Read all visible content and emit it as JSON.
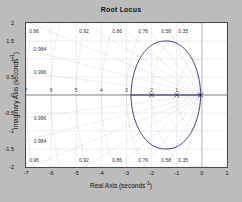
{
  "figure": {
    "background_color": "#bcbcbc",
    "plot_background_color": "#ffffff",
    "axis_color": "#4a4a4a"
  },
  "chart_data": {
    "type": "line",
    "title": "Root Locus",
    "xlabel_text": "Real Axis (seconds",
    "xlabel_exp": "-1",
    "xlabel_tail": ")",
    "ylabel_text": "Imaginary Axis (seconds",
    "ylabel_exp": "-1",
    "ylabel_tail": ")",
    "xlim": [
      -7,
      1
    ],
    "ylim": [
      -2,
      2
    ],
    "xticks": [
      "-7",
      "-6",
      "-5",
      "-4",
      "-3",
      "-2",
      "-1",
      "0",
      "1"
    ],
    "xtick_values": [
      -7,
      -6,
      -5,
      -4,
      -3,
      -2,
      -1,
      0,
      1
    ],
    "yticks": [
      "2",
      "1.5",
      "1",
      "0.5",
      "0",
      "-0.5",
      "-1",
      "-1.5",
      "-2"
    ],
    "ytick_values": [
      2,
      1.5,
      1,
      0.5,
      0,
      -0.5,
      -1,
      -1.5,
      -2
    ],
    "grid": "s-plane damping and natural frequency grid",
    "legend": "none",
    "grid_color": "#c8c8c8",
    "locus_color": "#1a1a6e",
    "marker_color": "#1a1a6e",
    "damping_ratios": [
      0.35,
      0.58,
      0.76,
      0.86,
      0.92,
      0.96,
      0.984,
      0.996
    ],
    "damping_labels_top": [
      "0.96",
      "0.92",
      "0.86",
      "0.76",
      "0.58",
      "0.35"
    ],
    "damping_labels_left_upper": [
      "0.984",
      "0.996"
    ],
    "damping_labels_left_lower": [
      "0.996",
      "0.984"
    ],
    "damping_labels_bottom": [
      "0.96",
      "0.92",
      "0.86",
      "0.76",
      "0.58",
      "0.35"
    ],
    "natural_frequencies": [
      1,
      2,
      3,
      4,
      5,
      6,
      7
    ],
    "natural_frequency_labels": [
      "7",
      "6",
      "5",
      "4",
      "3",
      "2",
      "1"
    ],
    "series": [
      {
        "name": "root-locus-branch",
        "description": "closed oval locus branch from breakaway near -2.8 to poles near origin",
        "real_left": -2.82,
        "real_right": -0.05,
        "imag_max": 1.5,
        "imag_min": -1.5
      },
      {
        "name": "real-axis-segment",
        "description": "locus segment along real axis",
        "from": -2.82,
        "to": -0.05
      }
    ],
    "markers": [
      {
        "type": "pole",
        "symbol": "x",
        "real": -0.05,
        "imag": 0
      },
      {
        "type": "pole",
        "symbol": "x",
        "real": -1.0,
        "imag": 0
      },
      {
        "type": "pole",
        "symbol": "x",
        "real": -2.0,
        "imag": 0
      }
    ]
  }
}
